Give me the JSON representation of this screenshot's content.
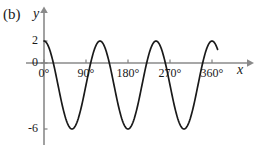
{
  "figure": {
    "panel_label": "(b)",
    "background_color": "#ffffff",
    "curve_color": "#1a1a1a",
    "axis_color": "#808080"
  },
  "axes": {
    "x_name": "x",
    "y_name": "y"
  },
  "chart_data": {
    "type": "line",
    "title": "(b)",
    "xlabel": "x",
    "ylabel": "y",
    "grid": false,
    "legend": false,
    "xlim": [
      0,
      400
    ],
    "ylim": [
      -7.2,
      3.2
    ],
    "x_tick_labels": [
      "0°",
      "90°",
      "180°",
      "270°",
      "360°"
    ],
    "x_ticks": [
      0,
      90,
      180,
      270,
      360
    ],
    "y_tick_labels": [
      "2",
      "0",
      "-6"
    ],
    "y_ticks": [
      2,
      0,
      -6
    ],
    "function": "y = 4 cos(3x) - 2",
    "amplitude": 4,
    "vertical_shift": -2,
    "period_degrees": 120,
    "maximum": 2,
    "minimum": -6,
    "x": [
      0,
      10,
      20,
      30,
      40,
      50,
      60,
      70,
      80,
      90,
      100,
      110,
      120,
      130,
      140,
      150,
      160,
      170,
      180,
      190,
      200,
      210,
      220,
      230,
      240,
      250,
      260,
      270,
      280,
      290,
      300,
      310,
      320,
      330,
      340,
      350,
      360
    ],
    "y": [
      2,
      1.46,
      -0.06,
      -2,
      -3.94,
      -5.46,
      -6,
      -5.46,
      -3.94,
      -2,
      -0.06,
      1.46,
      2,
      1.46,
      -0.06,
      -2,
      -3.94,
      -5.46,
      -6,
      -5.46,
      -3.94,
      -2,
      -0.06,
      1.46,
      2,
      1.46,
      -0.06,
      -2,
      -3.94,
      -5.46,
      -6,
      -5.46,
      -3.94,
      -2,
      -0.06,
      1.46,
      2
    ]
  }
}
